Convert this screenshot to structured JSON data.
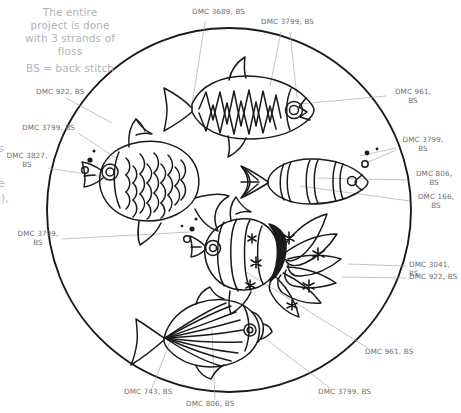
{
  "notes": {
    "intro": "The entire\nproject is done\nwith 3 strands of\nfloss",
    "legend": "BS = back stitch"
  },
  "colors": {
    "ink": "#1a1a1a",
    "label_text": "#6e6e73",
    "note_text": "#b3b3b6",
    "leader_line": "#9a9a9e",
    "background": "#ffffff"
  },
  "labels": [
    {
      "id": "top-left-922",
      "text": "DMC 922, BS",
      "x": 36,
      "y": 88,
      "align": "l"
    },
    {
      "id": "top-3689",
      "text": "DMC 3689, BS",
      "x": 192,
      "y": 8,
      "align": "l"
    },
    {
      "id": "top-3799",
      "text": "DMC 3799, BS",
      "x": 261,
      "y": 18,
      "align": "l"
    },
    {
      "id": "right-961",
      "text": "DMC 961,\nBS",
      "x": 388,
      "y": 90,
      "align": "l"
    },
    {
      "id": "left-3799-upper",
      "text": "DMC 3799, BS",
      "x": 22,
      "y": 124,
      "align": "l"
    },
    {
      "id": "left-3827",
      "text": "DMC 3827,\nBS",
      "x": 8,
      "y": 154,
      "align": "l"
    },
    {
      "id": "right-3799",
      "text": "DMC 3799,\nBS",
      "x": 399,
      "y": 137,
      "align": "l"
    },
    {
      "id": "right-806",
      "text": "DMC 806,\nBS",
      "x": 411,
      "y": 172,
      "align": "l"
    },
    {
      "id": "right-166",
      "text": "DMC 166,\nBS",
      "x": 414,
      "y": 194,
      "align": "l"
    },
    {
      "id": "left-3799-lower",
      "text": "DMC 3799,\nBS",
      "x": 17,
      "y": 231,
      "align": "l"
    },
    {
      "id": "right-3041",
      "text": "DMC 3041, BS",
      "x": 409,
      "y": 262,
      "align": "l"
    },
    {
      "id": "right-922",
      "text": "DMC 922, BS",
      "x": 409,
      "y": 274,
      "align": "l"
    },
    {
      "id": "right-961-lower",
      "text": "DMC 961, BS",
      "x": 365,
      "y": 349,
      "align": "l"
    },
    {
      "id": "bottom-743",
      "text": "DMC 743, BS",
      "x": 124,
      "y": 392,
      "align": "l"
    },
    {
      "id": "bottom-806",
      "text": "DMC 806, BS",
      "x": 186,
      "y": 404,
      "align": "l"
    },
    {
      "id": "bottom-3799",
      "text": "DMC 3799, BS",
      "x": 318,
      "y": 392,
      "align": "l"
    }
  ],
  "edge_fragments": [
    {
      "id": "frag-s",
      "text": "s",
      "x": 0,
      "y": 146
    },
    {
      "id": "frag-e",
      "text": "e",
      "x": 0,
      "y": 181
    },
    {
      "id": "frag-e2",
      "text": "e),",
      "x": 0,
      "y": 196
    }
  ],
  "diagram": {
    "hoop": {
      "cx": 229,
      "cy": 210,
      "r": 182
    },
    "fish": [
      {
        "id": "fish-zigzag",
        "name": "top-zigzag-fish"
      },
      {
        "id": "fish-scaled",
        "name": "left-scaled-fish"
      },
      {
        "id": "fish-striped",
        "name": "right-striped-fish"
      },
      {
        "id": "fish-starfin",
        "name": "center-star-fin-fish"
      },
      {
        "id": "fish-rayed",
        "name": "bottom-rayed-fish"
      }
    ]
  }
}
